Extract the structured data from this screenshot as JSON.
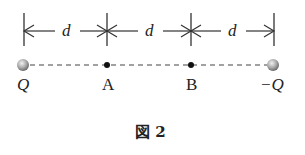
{
  "figure": {
    "caption": "図 2",
    "distance_label": "d",
    "points": [
      {
        "id": "Q",
        "label": "Q",
        "type": "charge",
        "x": 23
      },
      {
        "id": "A",
        "label": "A",
        "type": "point",
        "x": 107
      },
      {
        "id": "B",
        "label": "B",
        "type": "point",
        "x": 191
      },
      {
        "id": "negQ",
        "label": "−Q",
        "type": "charge",
        "x": 273
      }
    ],
    "segments": [
      {
        "label": "d"
      },
      {
        "label": "d"
      },
      {
        "label": "d"
      }
    ]
  }
}
